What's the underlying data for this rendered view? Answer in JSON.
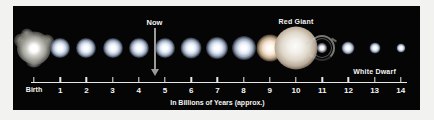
{
  "figure": {
    "background_color": "#050505",
    "margin_color": "#f2f2f0"
  },
  "chart_data": {
    "type": "scatter",
    "title": "",
    "xlabel": "In Billions of Years (approx.)",
    "ylabel": "",
    "xlim": [
      0,
      14
    ],
    "grid": false,
    "legend": false,
    "categories": [
      "Birth",
      "1",
      "2",
      "3",
      "4",
      "5",
      "6",
      "7",
      "8",
      "9",
      "10",
      "11",
      "12",
      "13",
      "14"
    ],
    "x": [
      0,
      1,
      2,
      3,
      4,
      5,
      6,
      7,
      8,
      9,
      10,
      11,
      12,
      13,
      14
    ],
    "series": [
      {
        "name": "Relative stellar size",
        "values": [
          17,
          13,
          13,
          13,
          13,
          13,
          13.5,
          14,
          15,
          17,
          30,
          9,
          7,
          6,
          5
        ]
      }
    ],
    "annotations": [
      {
        "text": "Now",
        "x": 4.6,
        "kind": "arrow-marker"
      },
      {
        "text": "Red Giant",
        "x": 10,
        "kind": "label"
      },
      {
        "text": "White Dwarf",
        "x": 13,
        "kind": "label"
      }
    ]
  },
  "axis": {
    "caption": "In Billions of Years (approx.)",
    "ticks": [
      {
        "label": "Birth",
        "value": 0
      },
      {
        "label": "1",
        "value": 1
      },
      {
        "label": "2",
        "value": 2
      },
      {
        "label": "3",
        "value": 3
      },
      {
        "label": "4",
        "value": 4
      },
      {
        "label": "5",
        "value": 5
      },
      {
        "label": "6",
        "value": 6
      },
      {
        "label": "7",
        "value": 7
      },
      {
        "label": "8",
        "value": 8
      },
      {
        "label": "9",
        "value": 9
      },
      {
        "label": "10",
        "value": 10
      },
      {
        "label": "11",
        "value": 11
      },
      {
        "label": "12",
        "value": 12
      },
      {
        "label": "13",
        "value": 13
      },
      {
        "label": "14",
        "value": 14
      }
    ]
  },
  "markers": {
    "now": {
      "label": "Now",
      "value": 4.6
    },
    "red_giant": {
      "label": "Red Giant",
      "value": 10
    },
    "white_dwarf": {
      "label": "White Dwarf",
      "value": 13
    }
  },
  "stars": [
    {
      "name": "protostar-cloud",
      "value": 0,
      "size": 34,
      "style": "cloud"
    },
    {
      "name": "main-sequence-1",
      "value": 1,
      "size": 20,
      "style": "white"
    },
    {
      "name": "main-sequence-2",
      "value": 2,
      "size": 20,
      "style": "white"
    },
    {
      "name": "main-sequence-3",
      "value": 3,
      "size": 20,
      "style": "white"
    },
    {
      "name": "main-sequence-4",
      "value": 4,
      "size": 20,
      "style": "white"
    },
    {
      "name": "main-sequence-5",
      "value": 5,
      "size": 20,
      "style": "white"
    },
    {
      "name": "main-sequence-6",
      "value": 6,
      "size": 21,
      "style": "white"
    },
    {
      "name": "main-sequence-7",
      "value": 7,
      "size": 22,
      "style": "white"
    },
    {
      "name": "subgiant-8",
      "value": 8,
      "size": 24,
      "style": "white"
    },
    {
      "name": "subgiant-9",
      "value": 9,
      "size": 27,
      "style": "warm"
    },
    {
      "name": "red-giant",
      "value": 10,
      "size": 43,
      "style": "giant"
    },
    {
      "name": "planetary-nebula",
      "value": 11,
      "size": 26,
      "style": "nebula"
    },
    {
      "name": "white-dwarf-12",
      "value": 12,
      "size": 13,
      "style": "white"
    },
    {
      "name": "white-dwarf-13",
      "value": 13,
      "size": 11,
      "style": "white"
    },
    {
      "name": "white-dwarf-14",
      "value": 14,
      "size": 9,
      "style": "white"
    }
  ]
}
